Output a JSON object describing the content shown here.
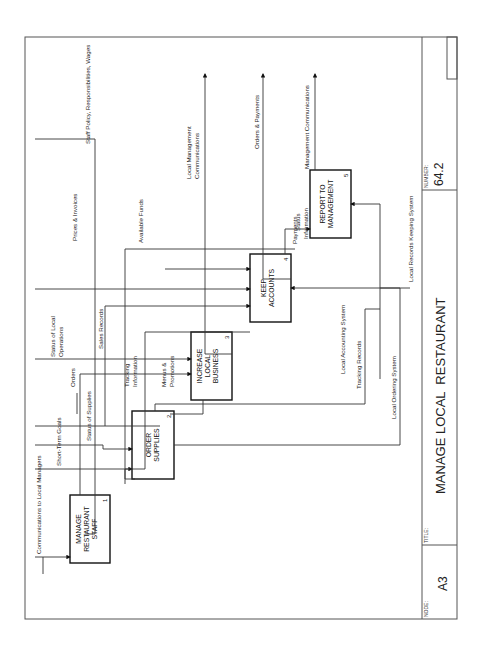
{
  "diagram": {
    "type": "IDEF0",
    "orientation": "rotated-90-ccw",
    "title_block": {
      "node_label": "NODE:",
      "node_value": "A3",
      "title_label": "TITLE:",
      "title_value": "MANAGE LOCAL  RESTAURANT",
      "number_label": "NUMBER:",
      "number_value": "64.2"
    },
    "boxes": [
      {
        "id": 1,
        "lines": [
          "MANAGE",
          "RESTAURANT",
          "STAFF"
        ],
        "number": "1"
      },
      {
        "id": 2,
        "lines": [
          "ORDER",
          "SUPPLIES"
        ],
        "number": "2"
      },
      {
        "id": 3,
        "lines": [
          "INCREASE",
          "LOCAL",
          "BUSINESS"
        ],
        "number": "3"
      },
      {
        "id": 4,
        "lines": [
          "KEEP",
          "ACCOUNTS"
        ],
        "number": "4"
      },
      {
        "id": 5,
        "lines": [
          "REPORT TO",
          "MANAGEMENT"
        ],
        "number": "5"
      }
    ],
    "arrows": {
      "communications_to_local_managers": "Communications to Local Managers",
      "short_term_goals": "Short-Term Goals",
      "status_of_supplies": "Status of Supplies",
      "status_of_local_operations_1": "Status of Local",
      "status_of_local_operations_2": "Operations",
      "orders": "Orders",
      "tracking_information_1": "Tracking",
      "tracking_information_2": "Information",
      "menus_promotions_1": "Menus &",
      "menus_promotions_2": "Promotions",
      "sales_records": "Sales Records",
      "prices_invoices": "Prices & Invoices",
      "available_funds": "Available Funds",
      "payments": "Payments",
      "status_information_1": "Status",
      "status_information_2": "Information",
      "staff_policy": "Staff Policy, Responsibilities, Wages",
      "local_mgmt_comm_1": "Local Management",
      "local_mgmt_comm_2": "Communications",
      "orders_payments": "Orders & Payments",
      "management_communications": "Management Communications",
      "local_accounting_system": "Local Accounting System",
      "tracking_records": "Tracking Records",
      "local_ordering_system": "Local Ordering System",
      "local_records_keeping_system": "Local Records Keeping System"
    }
  }
}
